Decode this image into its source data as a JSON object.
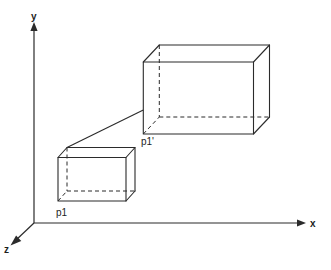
{
  "figure": {
    "kind": "3d-line-diagram",
    "background_color": "#ffffff",
    "stroke_color": "#2b2b2b"
  },
  "axes": {
    "origin": {
      "x": 34,
      "y": 223
    },
    "items": [
      {
        "id": "y",
        "label": "y",
        "direction": "up",
        "from": {
          "x": 34,
          "y": 223
        },
        "to": {
          "x": 34,
          "y": 25
        },
        "arrow": true
      },
      {
        "id": "x",
        "label": "x",
        "direction": "right",
        "from": {
          "x": 34,
          "y": 223
        },
        "to": {
          "x": 305,
          "y": 223
        },
        "arrow": true
      },
      {
        "id": "z",
        "label": "z",
        "direction": "down-left",
        "from": {
          "x": 34,
          "y": 223
        },
        "to": {
          "x": 11,
          "y": 245
        },
        "arrow": true
      }
    ]
  },
  "boxes": [
    {
      "id": "small-box",
      "name": "source-box",
      "front_face": {
        "left": 58,
        "right": 126,
        "top": 157.5,
        "bottom": 201
      },
      "depth_offset": {
        "dx": 9,
        "dy": -10
      },
      "anchor_point": "p1",
      "hidden_edges": [
        "back-vertical-left",
        "back-bottom-horizontal",
        "back-bottom-depth"
      ]
    },
    {
      "id": "large-box",
      "name": "transformed-box",
      "front_face": {
        "left": 143,
        "right": 253.5,
        "top": 62,
        "bottom": 134
      },
      "depth_offset": {
        "dx": 16,
        "dy": -17
      },
      "anchor_point": "p1'",
      "hidden_edges": [
        "back-vertical-left",
        "back-bottom-horizontal",
        "back-bottom-depth"
      ]
    }
  ],
  "points": [
    {
      "id": "p1",
      "label": "p1",
      "at": {
        "x": 67,
        "y": 191
      },
      "label_at": {
        "x": 56,
        "y": 208
      },
      "belongs_to": "small-box"
    },
    {
      "id": "p1prime",
      "label": "p1'",
      "at": {
        "x": 143,
        "y": 134
      },
      "label_at": {
        "x": 141,
        "y": 137
      },
      "belongs_to": "large-box"
    }
  ],
  "connector": {
    "id": "p1-to-p1prime",
    "label": "",
    "from": {
      "x": 67,
      "y": 147.5
    },
    "to": {
      "x": 143,
      "y": 110
    },
    "style": "solid"
  }
}
